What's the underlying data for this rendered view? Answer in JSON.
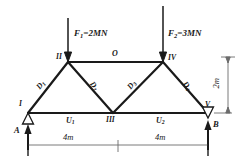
{
  "figure": {
    "type": "truss-free-body-diagram",
    "forces": [
      {
        "name": "F1",
        "label": "F",
        "sub": "1",
        "equals": "=2MN",
        "magnitude": 2,
        "unit": "MN",
        "applied_at_node": "II",
        "direction": "down"
      },
      {
        "name": "F2",
        "label": "F",
        "sub": "2",
        "equals": "=3MN",
        "magnitude": 3,
        "unit": "MN",
        "applied_at_node": "IV",
        "direction": "down"
      }
    ],
    "nodes": [
      {
        "id": "I",
        "label": "I",
        "x": 28,
        "y": 113
      },
      {
        "id": "II",
        "label": "II",
        "x": 68,
        "y": 62
      },
      {
        "id": "III",
        "label": "III",
        "x": 113,
        "y": 113
      },
      {
        "id": "IV",
        "label": "IV",
        "x": 163,
        "y": 62
      },
      {
        "id": "V",
        "label": "V",
        "x": 208,
        "y": 113
      }
    ],
    "members": [
      {
        "label": "D",
        "sub": "1",
        "kind": "diagonal",
        "from": "I",
        "to": "II"
      },
      {
        "label": "D",
        "sub": "2",
        "kind": "diagonal",
        "from": "II",
        "to": "III"
      },
      {
        "label": "D",
        "sub": "3",
        "kind": "diagonal",
        "from": "III",
        "to": "IV"
      },
      {
        "label": "D",
        "sub": "4",
        "kind": "diagonal",
        "from": "IV",
        "to": "V"
      },
      {
        "label": "O",
        "sub": "",
        "kind": "top-chord",
        "from": "II",
        "to": "IV"
      },
      {
        "label": "U",
        "sub": "1",
        "kind": "bottom-chord",
        "from": "I",
        "to": "III"
      },
      {
        "label": "U",
        "sub": "2",
        "kind": "bottom-chord",
        "from": "III",
        "to": "V"
      }
    ],
    "supports": [
      {
        "id": "A",
        "label": "A",
        "at_node": "I",
        "reaction": "up"
      },
      {
        "id": "B",
        "label": "B",
        "at_node": "V",
        "reaction": "up"
      }
    ],
    "dimensions": [
      {
        "id": "span-left",
        "text": "4m",
        "value": 4,
        "unit": "m",
        "orientation": "horizontal"
      },
      {
        "id": "span-right",
        "text": "4m",
        "value": 4,
        "unit": "m",
        "orientation": "horizontal"
      },
      {
        "id": "height",
        "text": "2m",
        "value": 2,
        "unit": "m",
        "orientation": "vertical"
      }
    ],
    "colors": {
      "line": "#1a1a1a",
      "thin_line": "#6b6b6b",
      "background": "#ffffff"
    }
  }
}
